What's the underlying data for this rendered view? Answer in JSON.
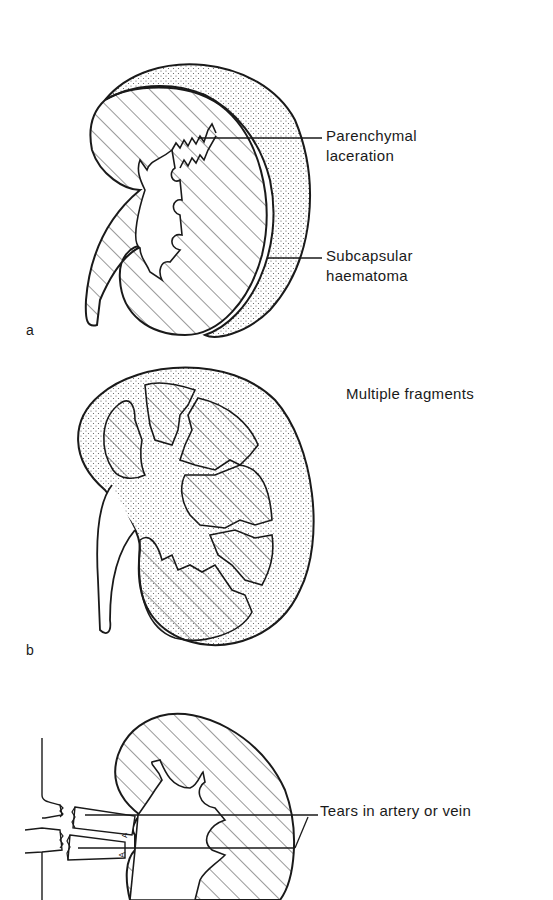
{
  "figure": {
    "panels": [
      {
        "id": "a",
        "panel_label": "a",
        "labels": {
          "parenchymal_line1": "Parenchymal",
          "parenchymal_line2": "laceration",
          "subcapsular_line1": "Subcapsular",
          "subcapsular_line2": "haematoma"
        }
      },
      {
        "id": "b",
        "panel_label": "b",
        "labels": {
          "fragments": "Multiple fragments"
        }
      },
      {
        "id": "c",
        "labels": {
          "tears": "Tears in artery or vein"
        },
        "vessel_marks": [
          "A",
          "A"
        ]
      }
    ],
    "colors": {
      "ink": "#1a1a1a",
      "background": "#ffffff",
      "stipple": "#555555"
    }
  }
}
